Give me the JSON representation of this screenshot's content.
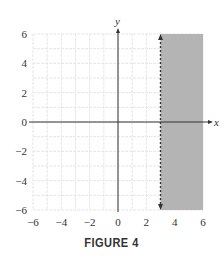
{
  "figure": {
    "caption": "FIGURE 4"
  },
  "chart_data": {
    "type": "area",
    "title": "",
    "xlabel": "x",
    "ylabel": "y",
    "xlim": [
      -6,
      6
    ],
    "ylim": [
      -6,
      6
    ],
    "x_ticks": [
      -6,
      -4,
      -2,
      0,
      2,
      4,
      6
    ],
    "y_ticks": [
      -6,
      -4,
      -2,
      0,
      2,
      4,
      6
    ],
    "x_tick_labels": [
      "−6",
      "−4",
      "−2",
      "0",
      "2",
      "4",
      "6"
    ],
    "y_tick_labels": [
      "−6",
      "−4",
      "−2",
      "0",
      "2",
      "4",
      "6"
    ],
    "grid": true,
    "grid_step": 1,
    "boundary": {
      "type": "vertical_line",
      "x": 3,
      "style": "dashed",
      "arrows": "both"
    },
    "shaded_region": {
      "x_min": 3,
      "x_max": 6,
      "y_min": -6,
      "y_max": 6,
      "inequality": "x > 3"
    },
    "colors": {
      "shade": "#b4b4b4",
      "grid": "#e6e6e6",
      "axis": "#333333",
      "boundary": "#333333"
    }
  }
}
